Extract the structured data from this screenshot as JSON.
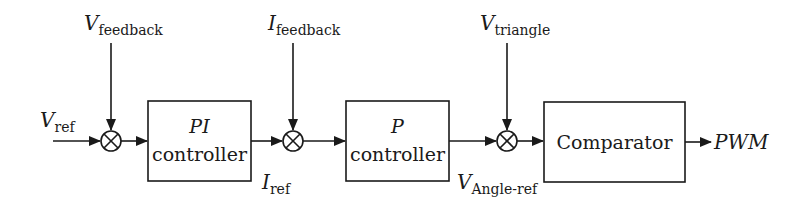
{
  "diagram": {
    "type": "block-diagram",
    "blocks": [
      {
        "id": "pi",
        "line1": "PI",
        "line2": "controller"
      },
      {
        "id": "p",
        "line1": "P",
        "line2": "controller"
      },
      {
        "id": "comparator",
        "line1": "Comparator"
      }
    ],
    "summing_junctions": [
      {
        "id": "sum1",
        "symbol": "⊗"
      },
      {
        "id": "sum2",
        "symbol": "⊗"
      },
      {
        "id": "sum3",
        "symbol": "⊗"
      }
    ],
    "signals": {
      "v_ref": {
        "main": "V",
        "sub": "ref"
      },
      "v_feedback": {
        "main": "V",
        "sub": "feedback"
      },
      "i_feedback": {
        "main": "I",
        "sub": "feedback"
      },
      "i_ref": {
        "main": "I",
        "sub": "ref"
      },
      "v_triangle": {
        "main": "V",
        "sub": "triangle"
      },
      "v_angle_ref": {
        "main": "V",
        "sub": "Angle-ref"
      },
      "pwm": {
        "main": "PWM"
      }
    },
    "connections": [
      "V_ref -> sum1",
      "V_feedback -> sum1",
      "sum1 -> PI controller",
      "PI controller -> sum2 (I_ref)",
      "I_feedback -> sum2",
      "sum2 -> P controller",
      "P controller -> sum3 (V_Angle-ref)",
      "V_triangle -> sum3",
      "sum3 -> Comparator",
      "Comparator -> PWM"
    ]
  }
}
